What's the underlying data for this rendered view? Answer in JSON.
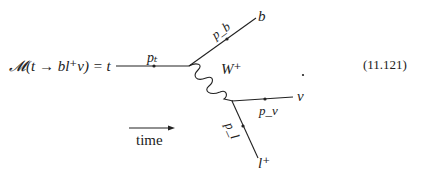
{
  "equation": {
    "lhs": "𝓜(t → bl⁺ν) = t",
    "trailing_period": ".",
    "number": "(11.121)"
  },
  "diagram": {
    "particles": {
      "top": "t",
      "bottom": "b",
      "w_boson": "W⁺",
      "neutrino": "ν",
      "lepton": "l⁺"
    },
    "momenta": {
      "top": "pₜ",
      "bottom": "p_b",
      "neutrino": "p_ν",
      "lepton": "p_l"
    },
    "time_arrow_label": "time"
  }
}
